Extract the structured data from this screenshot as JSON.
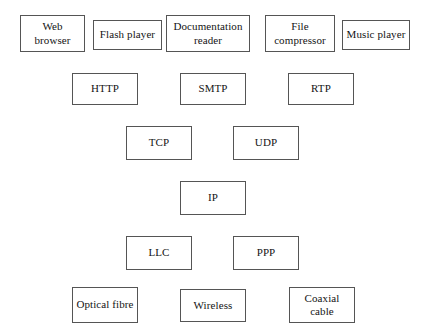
{
  "diagram": {
    "type": "layered-stack",
    "background_color": "#ffffff",
    "box_border_color": "#555555",
    "box_fill_color": "#ffffff",
    "text_color": "#141414",
    "connectors": "none",
    "layers": [
      {
        "name": "application",
        "nodes": [
          {
            "label": "Web browser",
            "x": 20,
            "y": 15,
            "w": 65,
            "h": 37
          },
          {
            "label": "Flash player",
            "x": 93,
            "y": 20,
            "w": 69,
            "h": 30
          },
          {
            "label": "Documentation reader",
            "x": 166,
            "y": 15,
            "w": 84,
            "h": 37
          },
          {
            "label": "File compressor",
            "x": 265,
            "y": 15,
            "w": 70,
            "h": 37
          },
          {
            "label": "Music player",
            "x": 342,
            "y": 20,
            "w": 68,
            "h": 30
          }
        ]
      },
      {
        "name": "application-protocol",
        "nodes": [
          {
            "label": "HTTP",
            "x": 72,
            "y": 73,
            "w": 66,
            "h": 32
          },
          {
            "label": "SMTP",
            "x": 180,
            "y": 73,
            "w": 66,
            "h": 32
          },
          {
            "label": "RTP",
            "x": 288,
            "y": 73,
            "w": 66,
            "h": 32
          }
        ]
      },
      {
        "name": "transport",
        "nodes": [
          {
            "label": "TCP",
            "x": 126,
            "y": 126,
            "w": 66,
            "h": 34
          },
          {
            "label": "UDP",
            "x": 233,
            "y": 126,
            "w": 66,
            "h": 34
          }
        ]
      },
      {
        "name": "network",
        "nodes": [
          {
            "label": "IP",
            "x": 180,
            "y": 181,
            "w": 66,
            "h": 34
          }
        ]
      },
      {
        "name": "data-link",
        "nodes": [
          {
            "label": "LLC",
            "x": 126,
            "y": 236,
            "w": 66,
            "h": 34
          },
          {
            "label": "PPP",
            "x": 233,
            "y": 236,
            "w": 66,
            "h": 34
          }
        ]
      },
      {
        "name": "physical",
        "nodes": [
          {
            "label": "Optical fibre",
            "x": 72,
            "y": 287,
            "w": 66,
            "h": 36
          },
          {
            "label": "Wireless",
            "x": 180,
            "y": 289,
            "w": 66,
            "h": 33
          },
          {
            "label": "Coaxial cable",
            "x": 289,
            "y": 287,
            "w": 66,
            "h": 36
          }
        ]
      }
    ]
  }
}
